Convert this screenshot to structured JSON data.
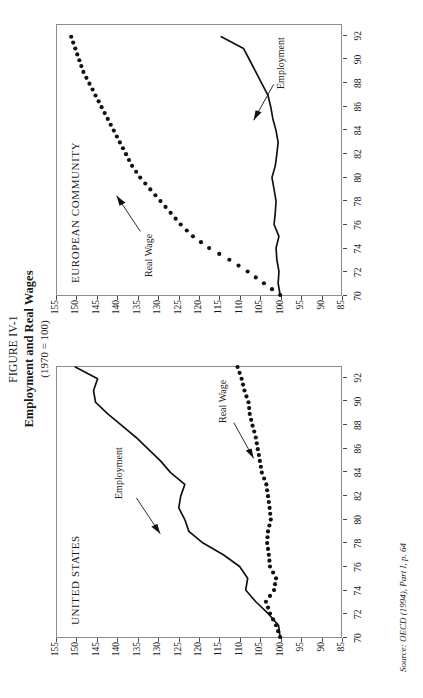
{
  "figure": {
    "number": "FIGURE IV-1",
    "title": "Employment and Real Wages",
    "subtitle": "(1970 = 100)",
    "source": "Source:  OECD (1994), Part I, p. 64"
  },
  "axes": {
    "y_ticks": [
      "155",
      "150",
      "145",
      "140",
      "135",
      "130",
      "125",
      "120",
      "115",
      "110",
      "105",
      "100",
      "95",
      "90",
      "85"
    ],
    "x_ticks": [
      "70",
      "72",
      "74",
      "76",
      "78",
      "80",
      "82",
      "84",
      "86",
      "88",
      "90",
      "92"
    ],
    "ylim": [
      85,
      155
    ],
    "xlim": [
      70,
      93
    ]
  },
  "annotations": {
    "us_employment": "Employment",
    "us_real_wage": "Real Wage",
    "ec_real_wage": "Real Wage",
    "ec_employment": "Employment"
  },
  "panels": {
    "us": {
      "label": "UNITED STATES"
    },
    "ec": {
      "label": "EUROPEAN COMMUNITY"
    }
  },
  "chart_data": [
    {
      "type": "line",
      "title": "UNITED STATES",
      "subtitle": "Employment and Real Wages (1970 = 100)",
      "xlabel": "",
      "ylabel": "",
      "xlim": [
        70,
        93
      ],
      "ylim": [
        85,
        155
      ],
      "grid": false,
      "legend": "inline-annotation",
      "x": [
        70,
        71,
        72,
        73,
        74,
        75,
        76,
        77,
        78,
        79,
        80,
        81,
        82,
        83,
        84,
        85,
        86,
        87,
        88,
        89,
        90,
        91,
        92,
        93
      ],
      "series": [
        {
          "name": "Employment",
          "style": "solid-line",
          "values": [
            100,
            100.4,
            103,
            106,
            108.5,
            108,
            110,
            114,
            119,
            122.5,
            123.5,
            125,
            124.5,
            123.5,
            127,
            129.5,
            132.5,
            135.5,
            139,
            142.5,
            145.5,
            146,
            145,
            150.5
          ]
        },
        {
          "name": "Real Wage",
          "style": "dotted",
          "values": [
            100,
            101,
            102.5,
            103.5,
            101.5,
            101,
            102.5,
            102.8,
            103.2,
            103,
            102.3,
            102.6,
            103,
            103.4,
            104.5,
            105,
            105.5,
            106,
            106.8,
            107.5,
            107.8,
            108.8,
            109.5,
            110.5
          ]
        }
      ]
    },
    {
      "type": "line",
      "title": "EUROPEAN COMMUNITY",
      "subtitle": "Employment and Real Wages (1970 = 100)",
      "xlabel": "",
      "ylabel": "",
      "xlim": [
        70,
        93
      ],
      "ylim": [
        85,
        155
      ],
      "grid": false,
      "legend": "inline-annotation",
      "x": [
        70,
        71,
        72,
        73,
        74,
        75,
        76,
        77,
        78,
        79,
        80,
        81,
        82,
        83,
        84,
        85,
        86,
        87,
        88,
        89,
        90,
        91,
        92
      ],
      "series": [
        {
          "name": "Real Wage",
          "style": "dotted",
          "values": [
            100,
            104,
            108,
            112.5,
            117.5,
            121.5,
            124.5,
            127,
            129.5,
            132,
            134.5,
            136.5,
            138,
            139.5,
            141,
            142.5,
            144,
            145.5,
            147,
            148.5,
            149.5,
            150.5,
            151.5
          ]
        },
        {
          "name": "Employment",
          "style": "solid-line",
          "values": [
            100,
            100.5,
            100.3,
            100.8,
            101,
            100.3,
            101.5,
            101.2,
            101,
            101.5,
            102,
            101.2,
            100.8,
            100.5,
            101,
            101.8,
            102.3,
            103,
            104.5,
            106,
            107.5,
            109,
            114.5
          ]
        }
      ]
    }
  ]
}
